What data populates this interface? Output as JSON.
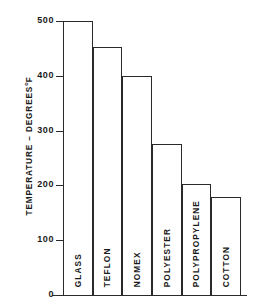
{
  "chart_data": {
    "type": "bar",
    "title": "",
    "xlabel": "",
    "ylabel": "TEMPERATURE - DEGREES °F",
    "ylabel_main": "TEMPERATURE – DEGREES",
    "ylabel_unit_sup": "o",
    "ylabel_unit": "F",
    "categories": [
      "GLASS",
      "TEFLON",
      "NOMEX",
      "POLYESTER",
      "POLYPROPYLENE",
      "COTTON"
    ],
    "values": [
      500,
      452,
      400,
      275,
      202,
      178
    ],
    "ylim": [
      0,
      500
    ],
    "yticks": [
      0,
      100,
      200,
      300,
      400,
      500
    ],
    "ytick_labels": [
      "0",
      "100",
      "200",
      "300",
      "400",
      "500"
    ],
    "grid": false,
    "legend": null,
    "bar_fill": "#ffffff",
    "bar_stroke": "#2a2a2a",
    "background": "#ffffff"
  }
}
